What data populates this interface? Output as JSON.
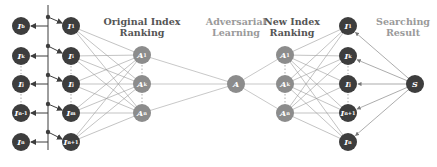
{
  "titles": {
    "original_ranking": [
      "Original Index",
      "Ranking"
    ],
    "adversarial_learning": [
      "Adversarial",
      "Learning"
    ],
    "new_ranking": [
      "New Index",
      "Ranking"
    ],
    "searching_result": [
      "Searching",
      "Result"
    ]
  },
  "colors": {
    "dark_node": "#3d3d3d",
    "gray_node": "#8c8c8c",
    "edge": "#9a9a9a",
    "arrow": "#3d3d3d"
  },
  "columns": {
    "input_left": [
      {
        "main": "I",
        "sub": "b",
        "x": 21,
        "y": 26
      },
      {
        "main": "I",
        "sub": "k",
        "x": 21,
        "y": 56
      },
      {
        "main": "I",
        "sub": "j",
        "x": 21,
        "y": 84
      },
      {
        "main": "I",
        "sub": "n-1",
        "x": 21,
        "y": 113
      },
      {
        "main": "I",
        "sub": "n",
        "x": 21,
        "y": 142
      }
    ],
    "original_index": [
      {
        "main": "I",
        "sub": "1",
        "x": 71,
        "y": 26
      },
      {
        "main": "I",
        "sub": "i",
        "x": 71,
        "y": 56
      },
      {
        "main": "I",
        "sub": "j",
        "x": 71,
        "y": 84
      },
      {
        "main": "I",
        "sub": "m",
        "x": 71,
        "y": 113
      },
      {
        "main": "I",
        "sub": "n+1",
        "x": 71,
        "y": 142
      }
    ],
    "adversarial_left": [
      {
        "main": "A",
        "sub": "1",
        "x": 142,
        "y": 55
      },
      {
        "main": "A",
        "sub": "k",
        "x": 142,
        "y": 84
      },
      {
        "main": "A",
        "sub": "n",
        "x": 142,
        "y": 113
      }
    ],
    "adversarial_center": [
      {
        "main": "A",
        "sub": "",
        "x": 236,
        "y": 84
      }
    ],
    "adversarial_right": [
      {
        "main": "A",
        "sub": "1",
        "x": 285,
        "y": 55
      },
      {
        "main": "A",
        "sub": "k",
        "x": 285,
        "y": 84
      },
      {
        "main": "A",
        "sub": "n",
        "x": 285,
        "y": 113
      }
    ],
    "new_index": [
      {
        "main": "I",
        "sub": "1",
        "x": 348,
        "y": 26
      },
      {
        "main": "I",
        "sub": "k",
        "x": 348,
        "y": 56
      },
      {
        "main": "I",
        "sub": "j",
        "x": 348,
        "y": 84
      },
      {
        "main": "I",
        "sub": "n+1",
        "x": 348,
        "y": 113
      },
      {
        "main": "I",
        "sub": "n",
        "x": 348,
        "y": 142
      }
    ],
    "search": [
      {
        "main": "S",
        "sub": "",
        "x": 415,
        "y": 84
      }
    ]
  },
  "bus": {
    "x": 48,
    "top": 5,
    "bottom": 150,
    "dots_y": [
      17,
      46,
      75,
      104,
      132
    ]
  }
}
